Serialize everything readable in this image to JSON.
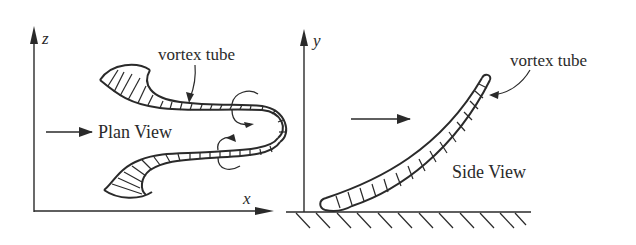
{
  "figure": {
    "panels": [
      {
        "name": "plan-view",
        "title": "Plan View",
        "axes": {
          "vertical": "z",
          "horizontal": "x"
        },
        "annotation": "vortex tube",
        "flow_direction": "left-to-right"
      },
      {
        "name": "side-view",
        "title": "Side View",
        "axes": {
          "vertical": "y"
        },
        "annotation": "vortex tube",
        "flow_direction": "left-to-right",
        "ground": "hatched wall"
      }
    ]
  },
  "plan": {
    "title": "Plan View",
    "z_label": "z",
    "x_label": "x",
    "tube_label": "vortex tube"
  },
  "side": {
    "title": "Side View",
    "y_label": "y",
    "tube_label": "vortex tube"
  },
  "colors": {
    "ink": "#2a2a2a",
    "background": "#ffffff"
  }
}
